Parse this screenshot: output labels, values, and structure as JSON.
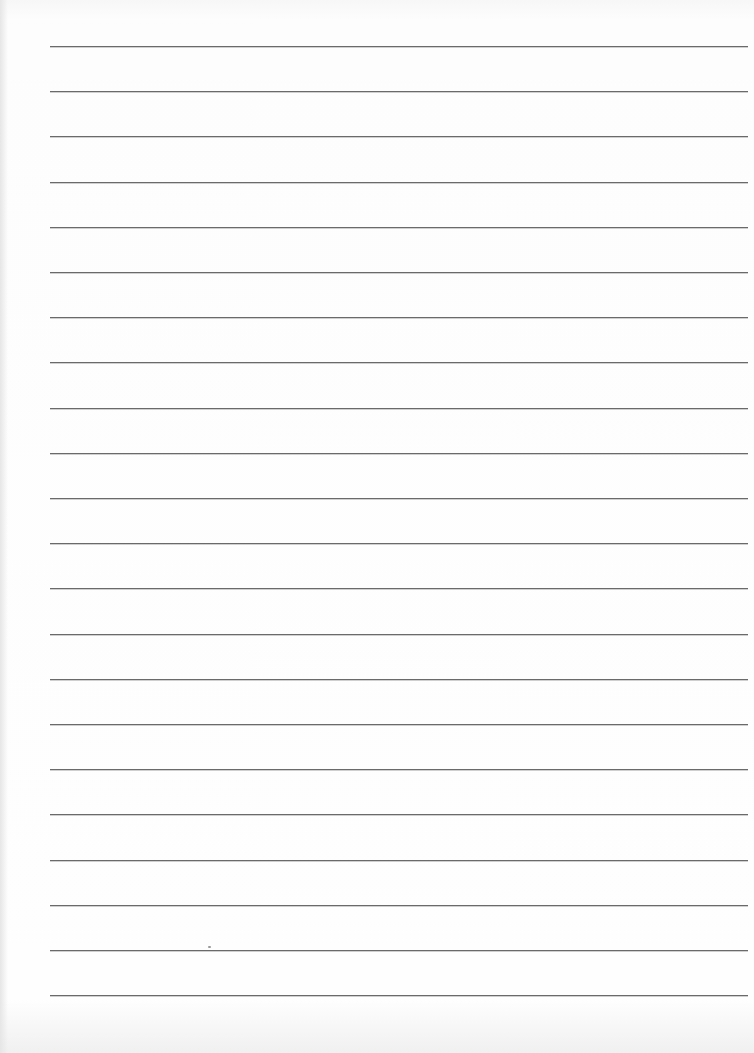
{
  "document": {
    "type": "lined-paper",
    "line_count": 22,
    "first_line_y": 46,
    "line_spacing": 45.2,
    "line_left": 50,
    "line_width": 698,
    "line_color": "#6a6a6a",
    "paper_color": "#fcfcfc",
    "lines": [
      "",
      "",
      "",
      "",
      "",
      "",
      "",
      "",
      "",
      "",
      "",
      "",
      "",
      "",
      "",
      "",
      "",
      "",
      "",
      "",
      "",
      ""
    ]
  }
}
